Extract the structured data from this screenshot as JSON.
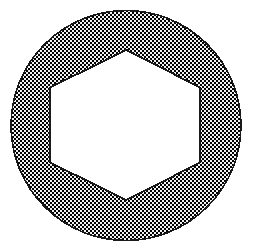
{
  "figure": {
    "name": "hex-socket-washer",
    "canvas": {
      "width": 255,
      "height": 252,
      "background_color": "#ffffff"
    },
    "shapes": {
      "outer_circle": {
        "label": "outer-circle",
        "center_x": 126,
        "center_y": 125.5,
        "radius": 115,
        "fill_style": "checkerboard-dither",
        "fill_color": "#555555",
        "outline_color": "#1a1a1a",
        "outline_width": 1.6
      },
      "inner_hexagon": {
        "label": "inner-hexagon",
        "orientation": "pointy-top",
        "center_x": 126.5,
        "center_y": 125,
        "circumradius": 76,
        "fill_color": "#ffffff",
        "outline_color": "#1a1a1a",
        "outline_width": 1.8,
        "points": "126.5,50 200,87.5 200,162.5 126.5,200 50,162.5 50,87.5",
        "vertices": [
          {
            "name": "top",
            "x": 126.5,
            "y": 50
          },
          {
            "name": "upper-right",
            "x": 200,
            "y": 87.5
          },
          {
            "name": "lower-right",
            "x": 200,
            "y": 162.5
          },
          {
            "name": "bottom",
            "x": 126.5,
            "y": 200
          },
          {
            "name": "lower-left",
            "x": 50,
            "y": 162.5
          },
          {
            "name": "upper-left",
            "x": 50,
            "y": 87.5
          }
        ]
      }
    },
    "dither": {
      "tile_size": 2,
      "dark_color": "#000000",
      "light_color": "#f2f2f2"
    }
  }
}
